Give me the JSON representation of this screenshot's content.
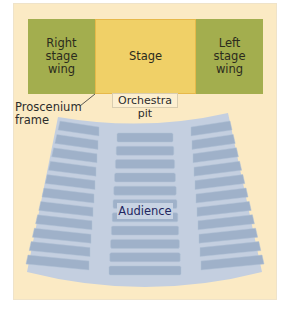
{
  "diagram": {
    "stage_area": {
      "right_wing": {
        "lines": [
          "Right",
          "stage",
          "wing"
        ]
      },
      "stage": {
        "label": "Stage"
      },
      "left_wing": {
        "lines": [
          "Left",
          "stage",
          "wing"
        ]
      }
    },
    "labels": {
      "proscenium": [
        "Proscenium",
        "frame"
      ],
      "orchestra_pit": "Orchestra pit",
      "audience": "Audience"
    },
    "colors": {
      "background": "#fbeac4",
      "wing": "#a3ae4e",
      "stage": "#f0d067",
      "audience_floor": "#c4cfe0",
      "seat": "#9fb1c9",
      "audience_text": "#1f2660"
    },
    "seating": {
      "sections": [
        "left",
        "center",
        "right"
      ],
      "rows_per_section": 11
    }
  }
}
